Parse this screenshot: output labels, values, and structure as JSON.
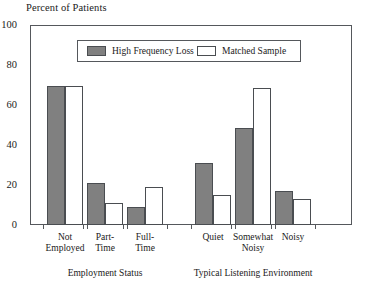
{
  "chart_data": {
    "type": "bar",
    "title": "Percent of Patients",
    "xlabel": "",
    "ylabel": "Percent of Patients",
    "ylim": [
      0,
      100
    ],
    "yticks": [
      0,
      20,
      40,
      60,
      80,
      100
    ],
    "grid": false,
    "legend_position": "top-center",
    "categories": [
      "Not\nEmployed",
      "Part-\nTime",
      "Full-\nTime",
      "Quiet",
      "Somewhat\nNoisy",
      "Noisy"
    ],
    "series": [
      {
        "name": "High Frequency Loss",
        "color": "#808080",
        "values": [
          70,
          21,
          9,
          31,
          49,
          17
        ]
      },
      {
        "name": "Matched Sample",
        "color": "#ffffff",
        "values": [
          70,
          11,
          19,
          15,
          69,
          13
        ]
      }
    ],
    "groups": [
      {
        "label": "Employment Status",
        "categories": [
          "Not\nEmployed",
          "Part-\nTime",
          "Full-\nTime"
        ]
      },
      {
        "label": "Typical Listening Environment",
        "categories": [
          "Quiet",
          "Somewhat\nNoisy",
          "Noisy"
        ]
      }
    ]
  },
  "axis": {
    "title": "Percent of Patients",
    "y_tick_labels": [
      "100",
      "80",
      "60",
      "40",
      "20",
      "0"
    ]
  },
  "legend": {
    "entries": [
      {
        "label": "High Frequency Loss",
        "color": "#808080"
      },
      {
        "label": "Matched Sample",
        "color": "#ffffff"
      }
    ]
  },
  "group_titles": {
    "left": "Employment Status",
    "right": "Typical Listening Environment"
  },
  "colors": {
    "series_high_frequency_loss": "#808080",
    "series_matched_sample": "#ffffff",
    "axis_line": "#55585c",
    "bar_outline": "#4a4d51",
    "text": "#1a1a1a",
    "background": "#ffffff"
  }
}
